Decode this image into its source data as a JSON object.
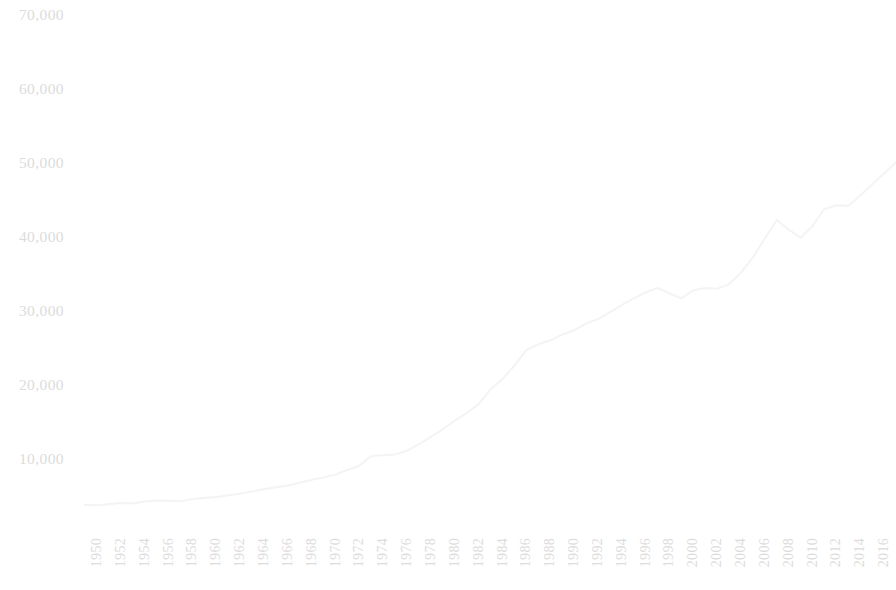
{
  "chart_data": {
    "type": "line",
    "title": "",
    "subtitle": "",
    "xlabel": "",
    "ylabel": "",
    "xlim": [
      1950,
      2018
    ],
    "ylim": [
      0,
      70000
    ],
    "grid": false,
    "legend": null,
    "y_ticks": [
      10000,
      20000,
      30000,
      40000,
      50000,
      60000,
      70000
    ],
    "y_tick_labels": [
      "10,000",
      "20,000",
      "30,000",
      "40,000",
      "50,000",
      "60,000",
      "70,000"
    ],
    "x_ticks": [
      1950,
      1952,
      1954,
      1956,
      1958,
      1960,
      1962,
      1964,
      1966,
      1968,
      1970,
      1972,
      1974,
      1976,
      1978,
      1980,
      1982,
      1984,
      1986,
      1988,
      1990,
      1992,
      1994,
      1996,
      1998,
      2000,
      2002,
      2004,
      2006,
      2008,
      2010,
      2012,
      2014,
      2016,
      2018
    ],
    "x_tick_labels": [
      "1950",
      "1952",
      "1954",
      "1956",
      "1958",
      "1960",
      "1962",
      "1964",
      "1966",
      "1968",
      "1970",
      "1972",
      "1974",
      "1976",
      "1978",
      "1980",
      "1982",
      "1984",
      "1986",
      "1988",
      "1990",
      "1992",
      "1994",
      "1996",
      "1998",
      "2000",
      "2002",
      "2004",
      "2006",
      "2008",
      "2010",
      "2012",
      "2014",
      "2016",
      "2018"
    ],
    "x_tick_rotation": -90,
    "series": [
      {
        "name": "series-1",
        "color": "#f4f4f4",
        "x": [
          1950,
          1951,
          1952,
          1953,
          1954,
          1955,
          1956,
          1957,
          1958,
          1959,
          1960,
          1961,
          1962,
          1963,
          1964,
          1965,
          1966,
          1967,
          1968,
          1969,
          1970,
          1971,
          1972,
          1973,
          1974,
          1975,
          1976,
          1977,
          1978,
          1979,
          1980,
          1981,
          1982,
          1983,
          1984,
          1985,
          1986,
          1987,
          1988,
          1989,
          1990,
          1991,
          1992,
          1993,
          1994,
          1995,
          1996,
          1997,
          1998,
          1999,
          2000,
          2001,
          2002,
          2003,
          2004,
          2005,
          2006,
          2007,
          2008,
          2009,
          2010,
          2011,
          2012,
          2013,
          2014,
          2015,
          2016,
          2017,
          2018
        ],
        "values": [
          3800,
          3750,
          3900,
          4050,
          4000,
          4250,
          4400,
          4350,
          4300,
          4600,
          4750,
          4850,
          5100,
          5300,
          5600,
          5900,
          6200,
          6400,
          6800,
          7200,
          7500,
          7900,
          8500,
          9100,
          10400,
          10500,
          10600,
          11100,
          12000,
          13000,
          14000,
          15200,
          16200,
          17400,
          19400,
          20800,
          22600,
          24700,
          25500,
          26000,
          26800,
          27400,
          28300,
          28900,
          29800,
          30800,
          31700,
          32500,
          33100,
          32400,
          31700,
          32800,
          33100,
          33000,
          33600,
          35200,
          37200,
          39800,
          42300,
          41000,
          39900,
          41500,
          43800,
          44300,
          44200,
          45600,
          47100,
          48600,
          50100
        ]
      }
    ]
  }
}
